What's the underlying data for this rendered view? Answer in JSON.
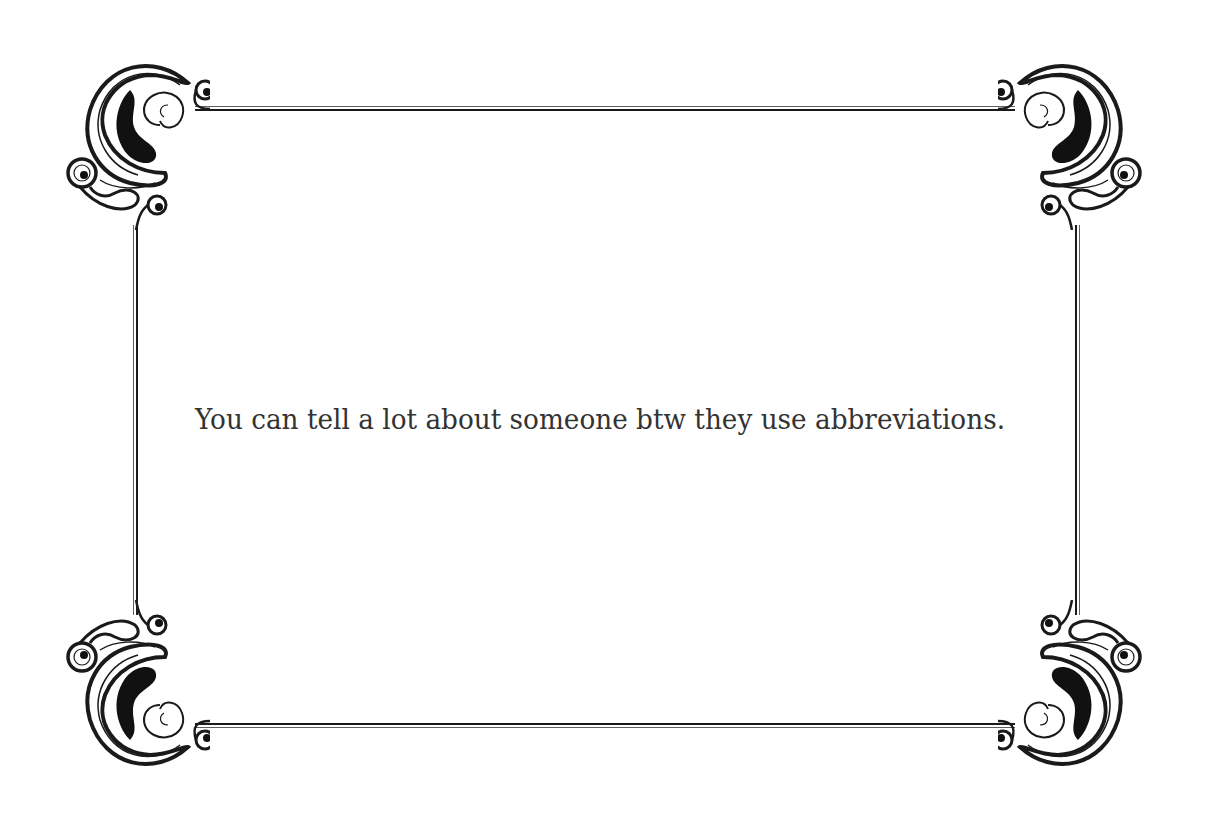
{
  "card": {
    "quote": "You can tell a lot about someone btw they use abbreviations.",
    "background_color": "#ffffff",
    "ink_color": "#1a1a1a",
    "text_color": "#333333"
  },
  "ornaments": {
    "top_left": "flourish-corner",
    "top_right": "flourish-corner",
    "bottom_left": "flourish-corner",
    "bottom_right": "flourish-corner"
  }
}
